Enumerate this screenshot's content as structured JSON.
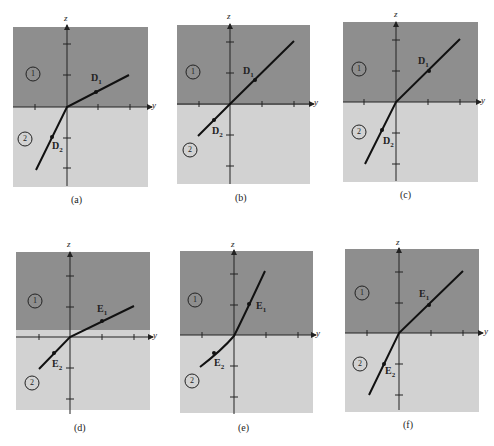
{
  "colors": {
    "region1": "#8e8e8e",
    "region2": "#d2d2d2",
    "axis": "#222222",
    "line": "#111111",
    "background": "#ffffff"
  },
  "axis_labels": {
    "vertical": "z",
    "horizontal": "y"
  },
  "region_labels": {
    "top": "1",
    "bottom": "2"
  },
  "panels": [
    {
      "caption": "(a)",
      "field_top": "D",
      "field_top_sub": "1",
      "field_bottom": "D",
      "field_bottom_sub": "2"
    },
    {
      "caption": "(b)",
      "field_top": "D",
      "field_top_sub": "1",
      "field_bottom": "D",
      "field_bottom_sub": "2"
    },
    {
      "caption": "(c)",
      "field_top": "D",
      "field_top_sub": "1",
      "field_bottom": "D",
      "field_bottom_sub": "2"
    },
    {
      "caption": "(d)",
      "field_top": "E",
      "field_top_sub": "1",
      "field_bottom": "E",
      "field_bottom_sub": "2"
    },
    {
      "caption": "(e)",
      "field_top": "E",
      "field_top_sub": "1",
      "field_bottom": "E",
      "field_bottom_sub": "2"
    },
    {
      "caption": "(f)",
      "field_top": "E",
      "field_top_sub": "1",
      "field_bottom": "E",
      "field_bottom_sub": "2"
    }
  ]
}
